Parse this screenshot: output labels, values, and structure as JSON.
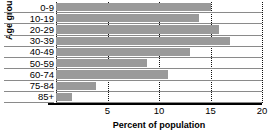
{
  "chart_data": {
    "type": "bar",
    "orientation": "horizontal",
    "title": "",
    "xlabel": "Percent of population",
    "ylabel": "Age groups",
    "categories": [
      "0-9",
      "10-19",
      "20-29",
      "30-39",
      "40-49",
      "50-59",
      "60-74",
      "75-84",
      "85+"
    ],
    "values": [
      15.0,
      13.9,
      15.8,
      16.9,
      13.0,
      8.8,
      10.9,
      3.9,
      1.6
    ],
    "xlim": [
      0,
      20
    ],
    "ylim": null,
    "xticks": [
      5,
      10,
      15,
      20
    ],
    "xtick_labels": [
      "5",
      "10",
      "15",
      "20"
    ],
    "grid": "vertical-dotted",
    "legend": "none",
    "bar_color": "#9a9a9a",
    "axis_color": "#000000",
    "gridline_color": "#111111",
    "row_rule_color": "#8a8a8a",
    "background": "#ffffff"
  },
  "axes": {
    "y_title": "Age groups",
    "x_title": "Percent of population"
  }
}
